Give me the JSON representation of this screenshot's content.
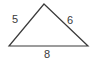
{
  "figure": {
    "kind": "triangle-diagram",
    "background_color": "#ffffff",
    "stroke_color": "#3a3a3a",
    "text_color": "#3a3a3a",
    "vertices": {
      "apex": [
        44,
        4
      ],
      "bottom_left": [
        9,
        46
      ],
      "bottom_right": [
        88,
        46
      ]
    },
    "labels": {
      "left_side": "5",
      "right_side": "6",
      "bottom_side": "8"
    }
  }
}
